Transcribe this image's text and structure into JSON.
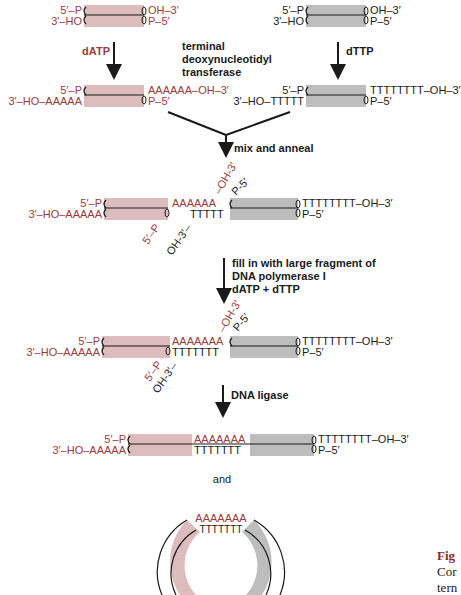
{
  "colors": {
    "pink_duplex": "#dcbcbc",
    "gray_duplex": "#bdbdbd",
    "red_text": "#9b3b3b",
    "black_text": "#1a1a1a",
    "caption_red": "#8b2a2a"
  },
  "row1": {
    "left": {
      "top_left": "5′–P",
      "bottom_left": "3′–HO",
      "top_right": "OH–3′",
      "bottom_right": "P–5′"
    },
    "right": {
      "top_left": "5′–P",
      "bottom_left": "3′–HO",
      "top_right": "OH–3′",
      "bottom_right": "P–5′"
    }
  },
  "step1": {
    "left_reagent": "dATP",
    "right_reagent": "dTTP",
    "enzyme_line1": "terminal",
    "enzyme_line2": "deoxynucleotidyl",
    "enzyme_line3": "transferase"
  },
  "row2": {
    "left": {
      "top_left": "5′–P",
      "bottom_left": "3′–HO–AAAAA",
      "top_right": "AAAAAA–OH–3′",
      "bottom_right": "P–5′"
    },
    "right": {
      "top_left": "5′–P",
      "bottom_left": "3′–HO–TTTTT",
      "top_right": "TTTTTTTT–OH–3′",
      "bottom_right": "P–5′"
    }
  },
  "step2": {
    "label": "mix and anneal"
  },
  "row3": {
    "top_left": "5′–P",
    "bottom_left": "3′–HO–AAAAA",
    "a_tail": "AAAAAA",
    "t_tail": "TTTTT",
    "diag_oh3_red": "–OH-3′",
    "diag_p5_black": "P-5′",
    "diag_5p_red": "5′–P",
    "diag_oh3_black": "OH-3′–",
    "top_right": "TTTTTTTT–OH–3′",
    "bottom_right": "P–5′"
  },
  "step3": {
    "line1": "fill in with large fragment of",
    "line2": "DNA polymerase I",
    "line3": "dATP + dTTP"
  },
  "row4": {
    "top_left": "5′–P",
    "bottom_left": "3′–HO–AAAAA",
    "a_tail": "AAAAAAA",
    "t_tail": "TTTTTTT",
    "diag_oh3_red": "–OH-3′",
    "diag_p5_black": "P-5′",
    "diag_5p_red": "5′–P",
    "diag_oh3_black": "OH-3′–",
    "top_right": "TTTTTTTT–OH–3′",
    "bottom_right": "P–5′"
  },
  "step4": {
    "label": "DNA ligase"
  },
  "row5": {
    "top_left": "5′–P",
    "bottom_left": "3′–HO–AAAAA",
    "a_tail": "AAAAAAA",
    "t_tail": "TTTTTTT",
    "top_right": "TTTTTTTT–OH–3′",
    "bottom_right": "P–5′"
  },
  "and_label": "and",
  "circle": {
    "a_tail": "AAAAAAA",
    "t_tail": "TTTTTTT"
  },
  "caption": {
    "line1": "Fig",
    "line2": "Cor",
    "line3": "tern"
  }
}
